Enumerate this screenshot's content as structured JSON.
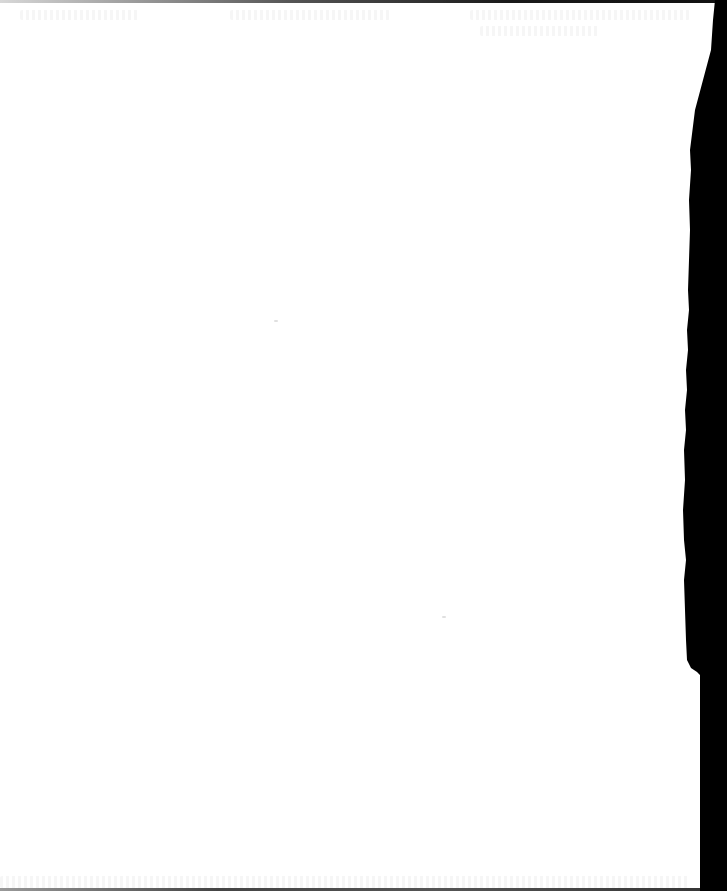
{
  "document": {
    "type": "scanned-page",
    "content_state": "blank page; faint illegible bleed-through only",
    "legible_text": []
  },
  "colors": {
    "paper": "#ffffff",
    "scanner_edge": "#000000",
    "bleed_through": "#f2f2f2"
  }
}
